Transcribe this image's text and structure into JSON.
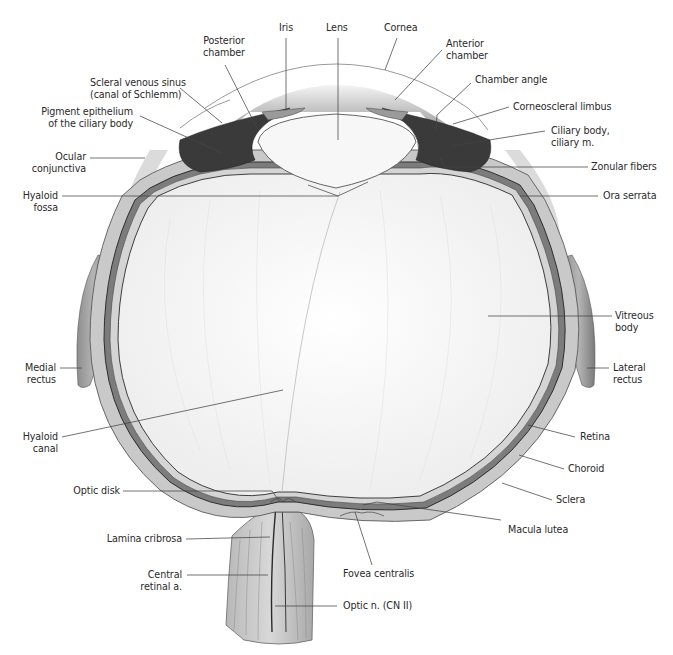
{
  "diagram": {
    "colors": {
      "background": "#ffffff",
      "label_text": "#2a2a2a",
      "leader_line": "#444444",
      "sclera": "#c9c9c9",
      "vitreous": "#f6f6f6",
      "pigment": "#2b2b2b"
    },
    "labels": {
      "posterior_chamber": [
        "Posterior",
        "chamber"
      ],
      "iris": "Iris",
      "lens": "Lens",
      "cornea": "Cornea",
      "anterior_chamber": [
        "Anterior",
        "chamber"
      ],
      "scleral_venous_sinus": [
        "Scleral venous sinus",
        "(canal of Schlemm)"
      ],
      "chamber_angle": "Chamber angle",
      "pigment_epithelium": [
        "Pigment epithelium",
        "of the ciliary body"
      ],
      "corneoscleral_limbus": "Corneoscleral limbus",
      "ciliary_body": [
        "Ciliary body,",
        "ciliary m."
      ],
      "ocular_conjunctiva": [
        "Ocular",
        "conjunctiva"
      ],
      "zonular_fibers": "Zonular fibers",
      "hyaloid_fossa": [
        "Hyaloid",
        "fossa"
      ],
      "ora_serrata": "Ora serrata",
      "vitreous_body": [
        "Vitreous",
        "body"
      ],
      "medial_rectus": [
        "Medial",
        "rectus"
      ],
      "lateral_rectus": [
        "Lateral",
        "rectus"
      ],
      "hyaloid_canal": [
        "Hyaloid",
        "canal"
      ],
      "retina": "Retina",
      "choroid": "Choroid",
      "sclera": "Sclera",
      "optic_disk": "Optic disk",
      "macula_lutea": "Macula lutea",
      "lamina_cribrosa": "Lamina cribrosa",
      "fovea_centralis": "Fovea centralis",
      "central_retinal_a": [
        "Central",
        "retinal a."
      ],
      "optic_n": "Optic n. (CN II)"
    }
  }
}
